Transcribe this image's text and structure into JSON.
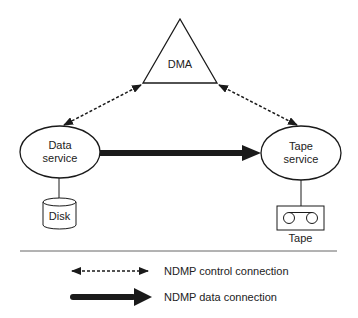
{
  "diagram": {
    "nodes": {
      "dma": {
        "label": "DMA",
        "shape": "triangle"
      },
      "data_service": {
        "line1": "Data",
        "line2": "service",
        "shape": "ellipse"
      },
      "tape_service": {
        "line1": "Tape",
        "line2": "service",
        "shape": "ellipse"
      },
      "disk": {
        "label": "Disk",
        "shape": "cylinder"
      },
      "tape": {
        "label": "Tape",
        "shape": "tape-drive"
      }
    },
    "edges": [
      {
        "from": "dma",
        "to": "data_service",
        "type": "NDMP control connection",
        "style": "dashed-bidirectional"
      },
      {
        "from": "dma",
        "to": "tape_service",
        "type": "NDMP control connection",
        "style": "dashed-bidirectional"
      },
      {
        "from": "data_service",
        "to": "tape_service",
        "type": "NDMP data connection",
        "style": "thick-arrow"
      },
      {
        "from": "data_service",
        "to": "disk",
        "type": "attachment",
        "style": "line"
      },
      {
        "from": "tape_service",
        "to": "tape",
        "type": "attachment",
        "style": "line"
      }
    ]
  },
  "legend": {
    "control": "NDMP control connection",
    "data": "NDMP data connection"
  },
  "colors": {
    "stroke": "#1a1a1a",
    "text": "#222222",
    "background": "#ffffff"
  }
}
